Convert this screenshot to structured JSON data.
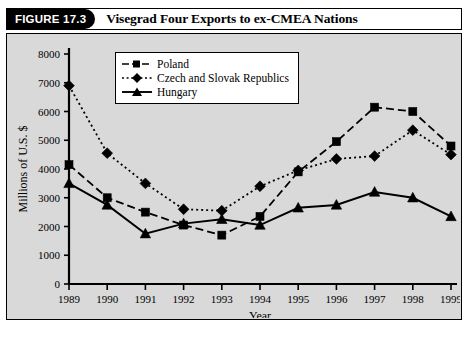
{
  "header": {
    "tag": "FIGURE 17.3",
    "title": "Visegrad Four Exports to ex-CMEA Nations"
  },
  "chart_data": {
    "type": "line",
    "title": "Visegrad Four Exports to ex-CMEA Nations",
    "xlabel": "Year",
    "ylabel": "Millions of U.S. $",
    "categories": [
      "1989",
      "1990",
      "1991",
      "1992",
      "1993",
      "1994",
      "1995",
      "1996",
      "1997",
      "1998",
      "1999"
    ],
    "ylim": [
      0,
      8000
    ],
    "yticks": [
      0,
      1000,
      2000,
      3000,
      4000,
      5000,
      6000,
      7000,
      8000
    ],
    "ytick_labels": [
      "0",
      "1000",
      "2000",
      "3000",
      "4000",
      "5000",
      "6000",
      "7000",
      "8000"
    ],
    "grid": false,
    "legend_position": "top-center",
    "series": [
      {
        "name": "Poland",
        "marker": "square",
        "dash": "dashed",
        "values": [
          4150,
          3000,
          2500,
          2050,
          1700,
          2350,
          3900,
          4950,
          6150,
          6000,
          4800
        ]
      },
      {
        "name": "Czech and Slovak Republics",
        "marker": "diamond",
        "dash": "dotted",
        "values": [
          6900,
          4550,
          3500,
          2600,
          2550,
          3400,
          3950,
          4350,
          4450,
          5350,
          4500
        ]
      },
      {
        "name": "Hungary",
        "marker": "triangle",
        "dash": "solid",
        "values": [
          3500,
          2750,
          1750,
          2100,
          2250,
          2050,
          2650,
          2750,
          3200,
          3000,
          2350
        ]
      }
    ]
  },
  "colors": {
    "plot_background": "#d9d9d9",
    "ink": "#000000",
    "panel_background": "#ffffff"
  }
}
